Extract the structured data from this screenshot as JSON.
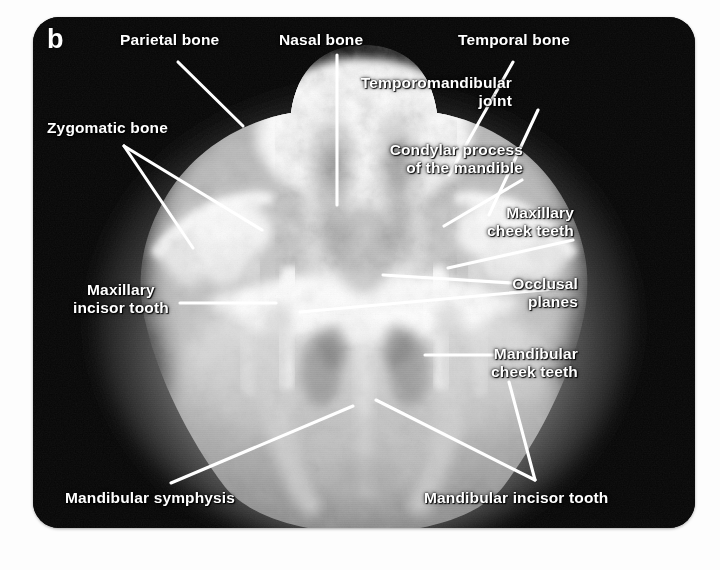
{
  "figure": {
    "panel_letter": "b",
    "modality": "radiograph",
    "view": "dorsoventral skull",
    "frame": {
      "background_color": "#ffffff",
      "plate_color": "#050505",
      "leader_color": "#ffffff",
      "label_color": "#ffffff"
    }
  },
  "annotations": [
    {
      "id": "parietal-bone",
      "label": "Parietal bone",
      "align": "left",
      "x": 120,
      "y": 31,
      "leaders": [
        [
          [
            178,
            62
          ],
          [
            243,
            126
          ]
        ]
      ]
    },
    {
      "id": "nasal-bone",
      "label": "Nasal bone",
      "align": "left",
      "x": 279,
      "y": 31,
      "leaders": [
        [
          [
            337,
            55
          ],
          [
            337,
            205
          ]
        ]
      ]
    },
    {
      "id": "temporal-bone",
      "label": "Temporal bone",
      "align": "left",
      "x": 458,
      "y": 31,
      "leaders": [
        [
          [
            513,
            62
          ],
          [
            449,
            175
          ]
        ]
      ]
    },
    {
      "id": "temporomandibular-joint",
      "label": "Temporomandibular\njoint",
      "align": "right",
      "x": 512,
      "y": 74,
      "leaders": [
        [
          [
            538,
            110
          ],
          [
            489,
            215
          ]
        ]
      ]
    },
    {
      "id": "condylar-process-of-the-mandible",
      "label": "Condylar process\nof the mandible",
      "align": "right",
      "x": 523,
      "y": 141,
      "leaders": [
        [
          [
            522,
            180
          ],
          [
            444,
            226
          ]
        ]
      ]
    },
    {
      "id": "maxillary-cheek-teeth",
      "label": "Maxillary\ncheek teeth",
      "align": "right",
      "x": 574,
      "y": 204,
      "leaders": [
        [
          [
            573,
            240
          ],
          [
            448,
            268
          ]
        ]
      ]
    },
    {
      "id": "occlusal-planes",
      "label": "Occlusal\nplanes",
      "align": "right",
      "x": 578,
      "y": 275,
      "leaders": [
        [
          [
            576,
            287
          ],
          [
            300,
            312
          ]
        ],
        [
          [
            576,
            287
          ],
          [
            383,
            275
          ]
        ]
      ]
    },
    {
      "id": "mandibular-cheek-teeth",
      "label": "Mandibular\ncheek teeth",
      "align": "right",
      "x": 578,
      "y": 345,
      "leaders": [
        [
          [
            570,
            355
          ],
          [
            425,
            355
          ]
        ]
      ]
    },
    {
      "id": "zygomatic-bone",
      "label": "Zygomatic bone",
      "align": "left",
      "x": 47,
      "y": 119,
      "leaders": [
        [
          [
            124,
            146
          ],
          [
            193,
            248
          ]
        ],
        [
          [
            124,
            146
          ],
          [
            262,
            230
          ]
        ]
      ]
    },
    {
      "id": "maxillary-incisor-tooth",
      "label": "Maxillary\nincisor tooth",
      "align": "center",
      "x": 73,
      "y": 281,
      "leaders": [
        [
          [
            180,
            303
          ],
          [
            276,
            303
          ]
        ]
      ]
    },
    {
      "id": "mandibular-symphysis",
      "label": "Mandibular symphysis",
      "align": "left",
      "x": 65,
      "y": 489,
      "leaders": [
        [
          [
            171,
            483
          ],
          [
            353,
            406
          ]
        ]
      ]
    },
    {
      "id": "mandibular-incisor-tooth",
      "label": "Mandibular incisor tooth",
      "align": "left",
      "x": 424,
      "y": 489,
      "leaders": [
        [
          [
            535,
            480
          ],
          [
            376,
            400
          ]
        ],
        [
          [
            535,
            480
          ],
          [
            509,
            382
          ]
        ]
      ]
    }
  ]
}
